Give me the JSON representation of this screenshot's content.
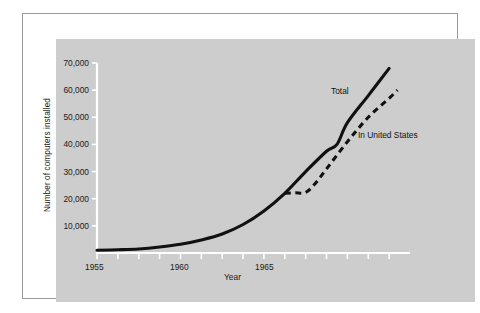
{
  "figure": {
    "panel_color": "#cdcdcd",
    "page_color": "#ffffff",
    "border_color": "#9a9a9a",
    "axis_color": "#ffffff",
    "line_color": "#111111"
  },
  "chart_data": {
    "type": "line",
    "title": "",
    "xlabel": "Year",
    "ylabel": "Number of computers installed",
    "xlim": [
      1955,
      1970
    ],
    "ylim": [
      0,
      70000
    ],
    "grid": false,
    "legend_position": "inline-annotation",
    "ytick_labels": [
      "10,000",
      "20,000",
      "30,000",
      "40,000",
      "50,000",
      "60,000",
      "70,000"
    ],
    "ytick_values": [
      10000,
      20000,
      30000,
      40000,
      50000,
      60000,
      70000
    ],
    "xtick_values": [
      1955,
      1956,
      1957,
      1958,
      1959,
      1960,
      1961,
      1962,
      1963,
      1964,
      1965,
      1966,
      1967,
      1968,
      1969
    ],
    "xtick_labels_shown": [
      "1955",
      "1960",
      "1965"
    ],
    "xtick_labeled_values": [
      1955,
      1960,
      1965
    ],
    "series": [
      {
        "name": "Total",
        "style": "solid",
        "x": [
          1955,
          1956,
          1957,
          1958,
          1959,
          1960,
          1961,
          1962,
          1963,
          1964,
          1965,
          1966,
          1966.5,
          1967,
          1968,
          1969
        ],
        "values": [
          1000,
          1200,
          1500,
          2200,
          3200,
          4800,
          7000,
          10500,
          15500,
          22000,
          30000,
          37500,
          40000,
          48000,
          58000,
          68000
        ]
      },
      {
        "name": "In United States",
        "style": "dashed",
        "x": [
          1964,
          1964.5,
          1965,
          1965.5,
          1966,
          1967,
          1968,
          1969,
          1969.4
        ],
        "values": [
          22000,
          22200,
          22300,
          26000,
          31000,
          41000,
          50000,
          57000,
          60000
        ]
      }
    ],
    "annotations": [
      {
        "text": "Total",
        "x": 1966.2,
        "y": 54000
      },
      {
        "text": "In United States",
        "x": 1967.4,
        "y": 42000
      }
    ]
  }
}
